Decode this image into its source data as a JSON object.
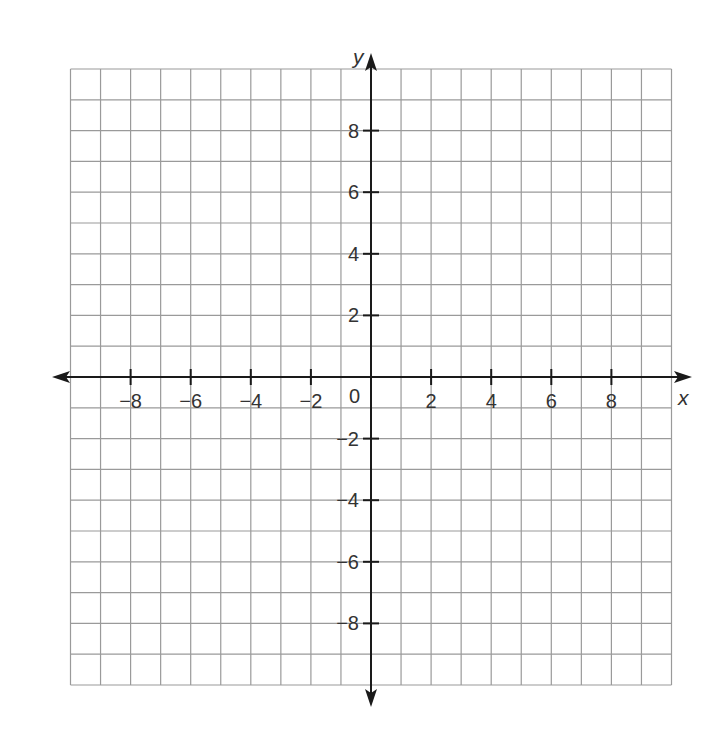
{
  "chart_data": {
    "type": "coordinate-grid",
    "xlabel": "x",
    "ylabel": "y",
    "xlim": [
      -10,
      10
    ],
    "ylim": [
      -10,
      10
    ],
    "grid": true,
    "grid_step": 1,
    "origin_label": "0",
    "x_ticks": [
      -8,
      -6,
      -4,
      -2,
      2,
      4,
      6,
      8
    ],
    "y_ticks": [
      8,
      6,
      4,
      2,
      -2,
      -4,
      -6,
      -8
    ],
    "x_tick_labels": [
      "−8",
      "−6",
      "−4",
      "−2",
      "2",
      "4",
      "6",
      "8"
    ],
    "y_tick_labels": [
      "8",
      "6",
      "4",
      "2",
      "−2",
      "−4",
      "−6",
      "−8"
    ]
  },
  "colors": {
    "grid": "#9a9a9a",
    "axis": "#1a1a1a",
    "text": "#333333"
  }
}
